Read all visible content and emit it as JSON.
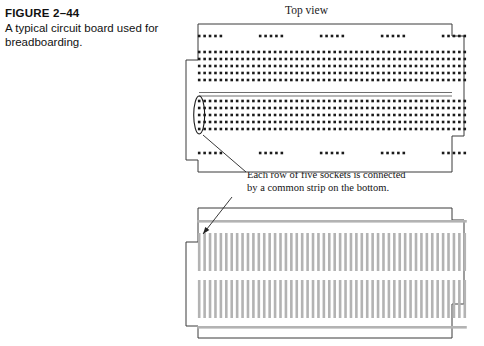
{
  "figure": {
    "number": "FIGURE 2–44",
    "caption_line_1": "A typical circuit board used for",
    "caption_line_2": "breadboarding.",
    "caption_full": "A typical circuit board used for breadboarding."
  },
  "labels": {
    "top_view": "Top view"
  },
  "annotation": {
    "line_1": "Each row of five sockets is connected",
    "line_2": "by a common strip on the bottom.",
    "full": "Each row of five sockets is connected by a common strip on the bottom."
  },
  "colors": {
    "background": "#ffffff",
    "outline": "#3a3a3a",
    "socket": "#1a1a1a",
    "strip_gray": "#b3b3b3",
    "leader_line": "#222222",
    "text": "#111111"
  },
  "top_board": {
    "x": 186,
    "y": 24,
    "width": 278,
    "height": 148,
    "notch_size": 12,
    "power_rail_top": {
      "groups": 5,
      "holes_per_group": 5,
      "y": 36
    },
    "power_rail_bottom": {
      "groups": 5,
      "holes_per_group": 5,
      "y": 153
    },
    "upper_grid": {
      "rows": 5,
      "columns": 50,
      "y_start": 52,
      "row_spacing": 7
    },
    "center_channel": {
      "y": 92,
      "height": 4
    },
    "lower_grid": {
      "rows": 5,
      "columns": 50,
      "y_start": 101,
      "row_spacing": 7
    },
    "highlight_ellipse": {
      "cx": 199,
      "cy": 115,
      "rx": 5.5,
      "ry": 19
    },
    "hole_size": 2.6,
    "column_spacing": 5.42
  },
  "bottom_board": {
    "x": 186,
    "y": 208,
    "width": 278,
    "height": 130,
    "notch_size": 12,
    "bus_strips": [
      {
        "name": "top-bus-strip",
        "y": 220
      },
      {
        "name": "bottom-bus-strip",
        "y": 326
      }
    ],
    "strip_banks": [
      {
        "name": "upper-strip-bank",
        "y": 233,
        "height": 38,
        "count": 50
      },
      {
        "name": "lower-strip-bank",
        "y": 280,
        "height": 38,
        "count": 50
      }
    ],
    "strip_width": 2.6
  },
  "leaders": [
    {
      "name": "socket-column-leader",
      "x1": 203,
      "y1": 135,
      "x2": 246,
      "y2": 172
    },
    {
      "name": "bottom-strip-leader",
      "x1": 232,
      "y1": 197,
      "x2": 203,
      "y2": 234
    }
  ]
}
